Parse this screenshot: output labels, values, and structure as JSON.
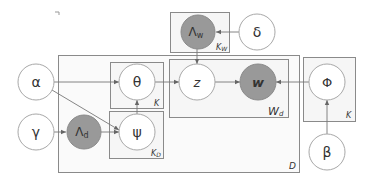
{
  "diagram": {
    "type": "plate-notation-graphical-model",
    "nodes": [
      {
        "id": "alpha",
        "label": "α",
        "observed": false
      },
      {
        "id": "gamma",
        "label": "γ",
        "observed": false
      },
      {
        "id": "lambda_d",
        "label": "Λ",
        "sub": "d",
        "observed": true
      },
      {
        "id": "theta",
        "label": "θ",
        "observed": false
      },
      {
        "id": "psi",
        "label": "ψ",
        "observed": false
      },
      {
        "id": "z",
        "label": "z",
        "observed": false
      },
      {
        "id": "w",
        "label": "w",
        "observed": true
      },
      {
        "id": "phi",
        "label": "Φ",
        "observed": false
      },
      {
        "id": "beta",
        "label": "β",
        "observed": false
      },
      {
        "id": "lambda_w",
        "label": "Λ",
        "sub": "w",
        "observed": true
      },
      {
        "id": "delta",
        "label": "δ",
        "observed": false
      }
    ],
    "plates": [
      {
        "id": "D",
        "label": "D"
      },
      {
        "id": "K_theta",
        "label": "K"
      },
      {
        "id": "K_D",
        "label": "K",
        "sub": "D"
      },
      {
        "id": "W_d",
        "label": "W",
        "sub": "d"
      },
      {
        "id": "K_phi",
        "label": "K"
      },
      {
        "id": "K_W",
        "label": "K",
        "sub": "W"
      }
    ],
    "edges": [
      {
        "from": "alpha",
        "to": "theta"
      },
      {
        "from": "alpha",
        "to": "psi"
      },
      {
        "from": "gamma",
        "to": "lambda_d"
      },
      {
        "from": "lambda_d",
        "to": "psi"
      },
      {
        "from": "psi",
        "to": "theta"
      },
      {
        "from": "theta",
        "to": "z"
      },
      {
        "from": "z",
        "to": "w"
      },
      {
        "from": "phi",
        "to": "w"
      },
      {
        "from": "beta",
        "to": "phi"
      },
      {
        "from": "delta",
        "to": "lambda_w"
      },
      {
        "from": "lambda_w",
        "to": "z"
      }
    ],
    "colors": {
      "observed_fill": "#999999",
      "latent_fill": "#ffffff",
      "stroke": "#8a8a8a",
      "text": "#333333"
    }
  }
}
